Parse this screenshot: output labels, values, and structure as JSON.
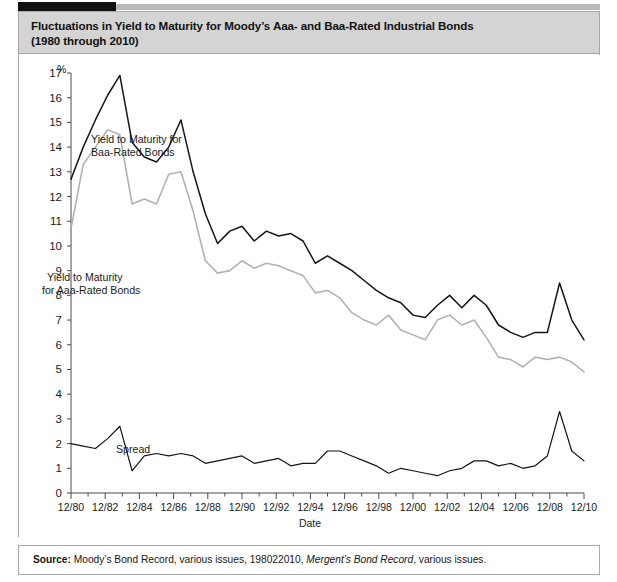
{
  "figure": {
    "title_line1": "Fluctuations in Yield to Maturity for Moody’s Aaa- and Baa-Rated Industrial Bonds",
    "title_line2": "(1980 through 2010)",
    "source_label": "Source:",
    "source_text_1": " Moody’s Bond Record, various issues, 198022010, ",
    "source_text_italic": "Mergent’s Bond Record",
    "source_text_2": ", various issues."
  },
  "annotations": {
    "baa_label_line1": "Yield to Maturity for",
    "baa_label_line2": "Baa-Rated Bonds",
    "aaa_label_line1": "Yield to Maturity",
    "aaa_label_line2": "for Aaa-Rated Bonds",
    "spread_label": "Spread"
  },
  "colors": {
    "baa_line": "#151515",
    "aaa_line": "#b2b2b2",
    "spread_line": "#151515",
    "title_band": "#d4d4d4",
    "frame_border": "#a8a8a8",
    "top_bar": "#111111"
  },
  "chart_data": {
    "type": "line",
    "title": "Fluctuations in Yield to Maturity for Moody’s Aaa- and Baa-Rated Industrial Bonds (1980 through 2010)",
    "xlabel": "Date",
    "ylabel": "%",
    "ylim": [
      0,
      17
    ],
    "yticks": [
      0,
      1,
      2,
      3,
      4,
      5,
      6,
      7,
      8,
      9,
      10,
      11,
      12,
      13,
      14,
      15,
      16,
      17
    ],
    "grid": false,
    "legend": "inline-annotations",
    "x": [
      "12/80",
      "12/81",
      "12/82",
      "12/83",
      "12/84",
      "12/85",
      "12/86",
      "12/87",
      "12/88",
      "12/89",
      "12/90",
      "12/91",
      "12/92",
      "12/93",
      "12/94",
      "12/95",
      "12/96",
      "12/97",
      "12/98",
      "12/99",
      "12/00",
      "12/01",
      "12/02",
      "12/03",
      "12/04",
      "12/05",
      "12/06",
      "12/07",
      "12/08",
      "12/09",
      "12/10"
    ],
    "xtick_labels": [
      "12/80",
      "12/82",
      "12/84",
      "12/86",
      "12/88",
      "12/90",
      "12/92",
      "12/94",
      "12/96",
      "12/98",
      "12/00",
      "12/02",
      "12/04",
      "12/06",
      "12/08",
      "12/10"
    ],
    "series": [
      {
        "name": "Yield to Maturity for Baa-Rated Bonds",
        "color": "#151515",
        "values": [
          12.7,
          15.1,
          16.9,
          13.6,
          13.4,
          15.1,
          11.3,
          10.1,
          10.8,
          10.6,
          10.4,
          10.2,
          9.3,
          9.6,
          9.0,
          8.2,
          7.7,
          7.2,
          7.1,
          8.0,
          7.5,
          8.0,
          7.6,
          6.8,
          6.5,
          6.3,
          6.5,
          6.5,
          8.5,
          7.0,
          6.2
        ],
        "yearly": [
          12.7,
          14.0,
          15.1,
          16.1,
          16.9,
          14.2,
          13.6,
          13.4,
          14.0,
          15.1,
          13.0,
          11.3,
          10.1,
          10.6,
          10.8,
          10.2,
          10.6,
          10.4,
          10.5,
          10.2,
          9.3,
          9.6,
          9.3,
          9.0,
          8.6,
          8.2,
          7.9,
          7.7,
          7.2,
          7.1,
          7.6,
          8.0,
          7.5,
          8.0,
          7.6,
          6.8,
          6.5,
          6.3,
          6.5,
          6.5,
          8.5,
          7.0,
          6.2
        ]
      },
      {
        "name": "Yield to Maturity for Aaa-Rated Bonds",
        "color": "#b2b2b2",
        "values": [
          10.7,
          13.3,
          14.7,
          11.7,
          11.9,
          13.0,
          9.4,
          8.9,
          9.4,
          9.1,
          9.2,
          8.8,
          8.1,
          7.9,
          7.3,
          6.8,
          6.6,
          6.4,
          6.2,
          7.2,
          6.8,
          7.0,
          6.3,
          5.5,
          5.4,
          5.1,
          5.5,
          5.4,
          5.5,
          5.3,
          4.9
        ],
        "yearly": [
          10.7,
          13.3,
          14.0,
          14.7,
          14.5,
          11.7,
          11.9,
          11.7,
          12.9,
          13.0,
          11.4,
          9.4,
          8.9,
          9.0,
          9.4,
          9.1,
          9.3,
          9.2,
          9.0,
          8.8,
          8.1,
          8.2,
          7.9,
          7.3,
          7.0,
          6.8,
          7.2,
          6.6,
          6.4,
          6.2,
          7.0,
          7.2,
          6.8,
          7.0,
          6.3,
          5.5,
          5.4,
          5.1,
          5.5,
          5.4,
          5.5,
          5.3,
          4.9
        ]
      },
      {
        "name": "Spread",
        "color": "#151515",
        "values": [
          2.0,
          1.8,
          2.2,
          1.9,
          1.5,
          2.1,
          1.9,
          1.2,
          1.4,
          1.5,
          1.2,
          1.4,
          1.2,
          1.7,
          1.7,
          1.4,
          1.1,
          0.8,
          0.9,
          0.8,
          0.7,
          1.0,
          1.3,
          1.3,
          1.1,
          1.2,
          1.0,
          1.1,
          3.0,
          1.7,
          1.3
        ],
        "yearly": [
          2.0,
          1.9,
          1.8,
          2.2,
          2.7,
          0.9,
          1.5,
          1.6,
          1.5,
          1.6,
          1.5,
          1.2,
          1.3,
          1.4,
          1.5,
          1.2,
          1.3,
          1.4,
          1.1,
          1.2,
          1.2,
          1.7,
          1.7,
          1.5,
          1.3,
          1.1,
          0.8,
          1.0,
          0.9,
          0.8,
          0.7,
          0.9,
          1.0,
          1.3,
          1.3,
          1.1,
          1.2,
          1.0,
          1.1,
          1.5,
          3.3,
          1.7,
          1.3
        ]
      }
    ]
  }
}
